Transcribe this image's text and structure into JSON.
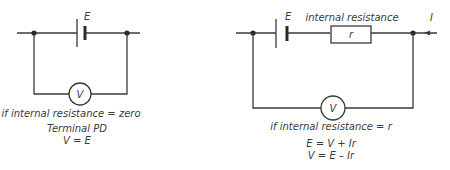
{
  "left_circuit": {
    "emf_label": "E",
    "meter_label": "V",
    "caption": "if internal resistance = zero",
    "subcaption": "Terminal PD",
    "equation": "V = E"
  },
  "right_circuit": {
    "emf_label": "E",
    "resistor_heading": "internal resistance",
    "resistor_label": "r",
    "current_label": "I",
    "meter_label": "V",
    "caption": "if internal resistance = r",
    "equations": [
      "E = V + Ir",
      "V = E – Ir"
    ]
  },
  "colors": {
    "line": "#3a3a3a",
    "background": "#ffffff"
  }
}
